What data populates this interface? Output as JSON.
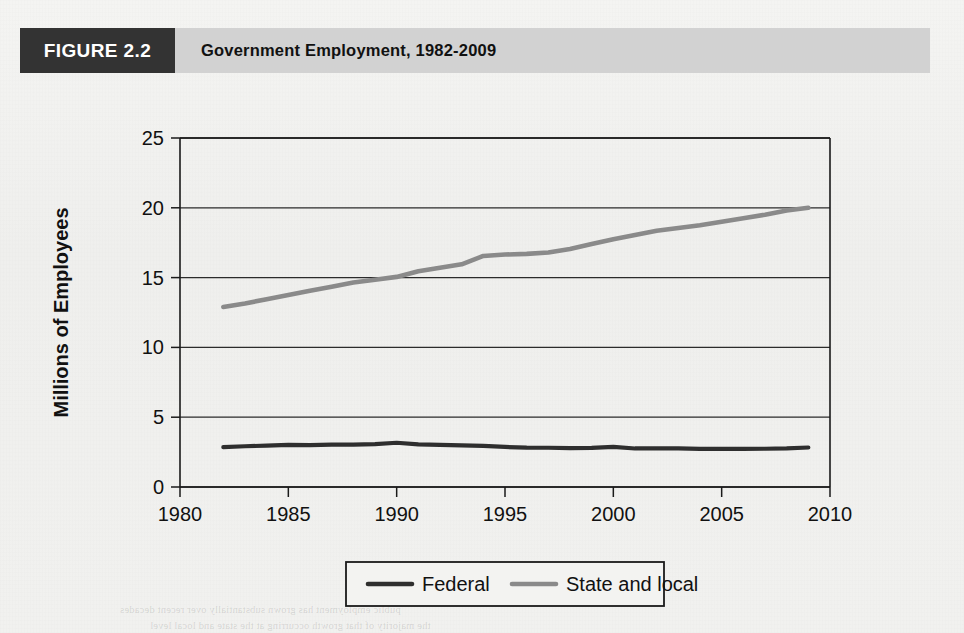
{
  "figure": {
    "number_label": "FIGURE 2.2",
    "title": "Government Employment, 1982-2009"
  },
  "colors": {
    "header_band": "#d2d2d2",
    "number_box": "#333333",
    "federal_line": "#2e2e2e",
    "state_local_line": "#8a8a8a",
    "axis": "#1a1a1a",
    "page": "#f2f2f0"
  },
  "chart_data": {
    "type": "line",
    "title": "Government Employment, 1982-2009",
    "xlabel": "",
    "ylabel": "Millions of Employees",
    "xlim": [
      1980,
      2010
    ],
    "ylim": [
      0,
      25
    ],
    "xticks": [
      1980,
      1985,
      1990,
      1995,
      2000,
      2005,
      2010
    ],
    "yticks": [
      0,
      5,
      10,
      15,
      20,
      25
    ],
    "xtick_labels": [
      "1980",
      "1985",
      "1990",
      "1995",
      "2000",
      "2005",
      "2010"
    ],
    "ytick_labels": [
      "0",
      "5",
      "10",
      "15",
      "20",
      "25"
    ],
    "grid": "horizontal",
    "legend_position": "bottom-center",
    "x": [
      1982,
      1983,
      1984,
      1985,
      1986,
      1987,
      1988,
      1989,
      1990,
      1991,
      1992,
      1993,
      1994,
      1995,
      1996,
      1997,
      1998,
      1999,
      2000,
      2001,
      2002,
      2003,
      2004,
      2005,
      2006,
      2007,
      2008,
      2009
    ],
    "series": [
      {
        "name": "Federal",
        "color": "#2e2e2e",
        "values": [
          2.85,
          2.92,
          2.96,
          3.02,
          3.0,
          3.03,
          3.04,
          3.07,
          3.17,
          3.05,
          3.02,
          2.98,
          2.94,
          2.87,
          2.82,
          2.81,
          2.79,
          2.8,
          2.87,
          2.76,
          2.77,
          2.76,
          2.73,
          2.73,
          2.73,
          2.74,
          2.76,
          2.83
        ]
      },
      {
        "name": "State and local",
        "color": "#8a8a8a",
        "values": [
          12.9,
          13.15,
          13.45,
          13.75,
          14.05,
          14.35,
          14.65,
          14.85,
          15.05,
          15.45,
          15.7,
          15.95,
          16.55,
          16.65,
          16.7,
          16.8,
          17.05,
          17.4,
          17.75,
          18.05,
          18.35,
          18.55,
          18.75,
          19.0,
          19.25,
          19.5,
          19.8,
          20.0
        ]
      }
    ],
    "annotations": [
      {
        "text": "Federal employment remains nearly flat near 3 million across the period."
      },
      {
        "text": "State and local employment rises steadily from about 13 million to about 20 million."
      }
    ]
  },
  "legend": {
    "items": [
      {
        "label": "Federal",
        "color": "#2e2e2e"
      },
      {
        "label": "State and local",
        "color": "#8a8a8a"
      }
    ]
  },
  "bleed_through": {
    "line1": "public employment has grown substantially over recent decades",
    "line2": "the majority of that growth occurring at the state and local level"
  }
}
